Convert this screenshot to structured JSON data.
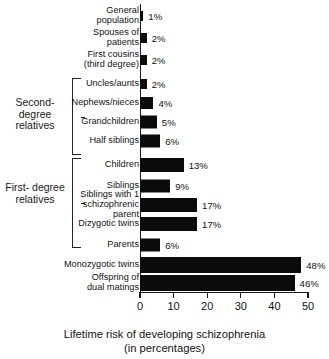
{
  "chart_data": {
    "type": "bar",
    "orientation": "horizontal",
    "title": "",
    "xlabel": "Lifetime risk of developing schizophrenia\n(in percentages)",
    "ylabel": "",
    "xlim": [
      0,
      50
    ],
    "xticks": [
      0,
      10,
      20,
      30,
      40,
      50
    ],
    "grid": false,
    "legend": null,
    "bar_color": "#0b0b0b",
    "categories": [
      "General\npopulation",
      "Spouses of\npatients",
      "First cousins\n(third degree)",
      "Uncles/aunts",
      "Nephews/nieces",
      "Grandchildren",
      "Half siblings",
      "Children",
      "Siblings",
      "Siblings with 1\nschizophrenic\nparent",
      "Dizygotic twins",
      "Parents",
      "Monozygotic twins",
      "Offspring of\ndual matings"
    ],
    "values": [
      1,
      2,
      2,
      2,
      4,
      5,
      6,
      13,
      9,
      17,
      17,
      6,
      48,
      46
    ],
    "value_labels": [
      "1%",
      "2%",
      "2%",
      "2%",
      "4%",
      "5%",
      "6%",
      "13%",
      "9%",
      "17%",
      "17%",
      "6%",
      "48%",
      "46%"
    ],
    "annotations": [
      {
        "label": "Second-\ndegree\nrelatives",
        "covers": [
          "Uncles/aunts",
          "Nephews/nieces",
          "Grandchildren",
          "Half siblings"
        ]
      },
      {
        "label": "First-\ndegree\nrelatives",
        "covers": [
          "Children",
          "Siblings",
          "Siblings with 1 schizophrenic parent",
          "Dizygotic twins",
          "Parents"
        ]
      }
    ]
  },
  "groups": {
    "second_degree": "Second-\ndegree\nrelatives",
    "first_degree": "First-\ndegree\nrelatives"
  },
  "axis": {
    "title": "Lifetime risk of developing schizophrenia\n(in percentages)",
    "ticks": [
      "0",
      "10",
      "20",
      "30",
      "40",
      "50"
    ]
  }
}
